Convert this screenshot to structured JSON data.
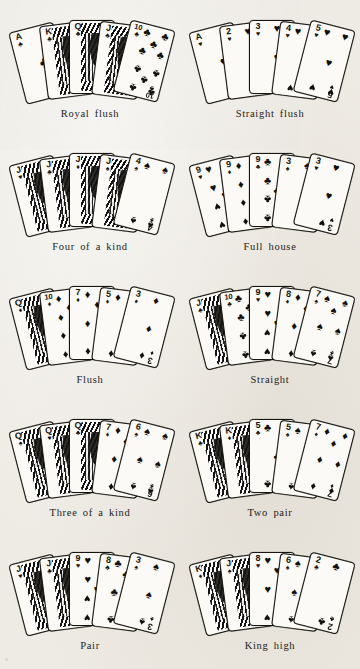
{
  "page": {
    "background_color": "#eeebe4",
    "ink_color": "#15130e",
    "corner_mark": "°"
  },
  "suits": {
    "spade": "♠",
    "heart": "♥",
    "diamond": "♦",
    "club": "♣"
  },
  "hands": [
    {
      "label": "Royal flush",
      "cards": [
        {
          "rank": "A",
          "suit": "club",
          "face": false
        },
        {
          "rank": "K",
          "suit": "club",
          "face": true
        },
        {
          "rank": "Q",
          "suit": "club",
          "face": true
        },
        {
          "rank": "J",
          "suit": "club",
          "face": true
        },
        {
          "rank": "10",
          "suit": "club",
          "face": false
        }
      ]
    },
    {
      "label": "Straight flush",
      "cards": [
        {
          "rank": "A",
          "suit": "heart",
          "face": false
        },
        {
          "rank": "2",
          "suit": "heart",
          "face": false
        },
        {
          "rank": "3",
          "suit": "heart",
          "face": false
        },
        {
          "rank": "4",
          "suit": "heart",
          "face": false
        },
        {
          "rank": "5",
          "suit": "heart",
          "face": false
        }
      ]
    },
    {
      "label": "Four of a kind",
      "cards": [
        {
          "rank": "J",
          "suit": "heart",
          "face": true
        },
        {
          "rank": "J",
          "suit": "club",
          "face": true
        },
        {
          "rank": "J",
          "suit": "diamond",
          "face": true
        },
        {
          "rank": "J",
          "suit": "spade",
          "face": true
        },
        {
          "rank": "4",
          "suit": "spade",
          "face": false
        }
      ]
    },
    {
      "label": "Full house",
      "cards": [
        {
          "rank": "9",
          "suit": "heart",
          "face": false
        },
        {
          "rank": "9",
          "suit": "diamond",
          "face": false
        },
        {
          "rank": "9",
          "suit": "club",
          "face": false
        },
        {
          "rank": "3",
          "suit": "spade",
          "face": false
        },
        {
          "rank": "3",
          "suit": "heart",
          "face": false
        }
      ]
    },
    {
      "label": "Flush",
      "cards": [
        {
          "rank": "Q",
          "suit": "diamond",
          "face": true
        },
        {
          "rank": "10",
          "suit": "diamond",
          "face": false
        },
        {
          "rank": "7",
          "suit": "diamond",
          "face": false
        },
        {
          "rank": "5",
          "suit": "diamond",
          "face": false
        },
        {
          "rank": "3",
          "suit": "diamond",
          "face": false
        }
      ]
    },
    {
      "label": "Straight",
      "cards": [
        {
          "rank": "J",
          "suit": "club",
          "face": true
        },
        {
          "rank": "10",
          "suit": "club",
          "face": false
        },
        {
          "rank": "9",
          "suit": "heart",
          "face": false
        },
        {
          "rank": "8",
          "suit": "diamond",
          "face": false
        },
        {
          "rank": "7",
          "suit": "spade",
          "face": false
        }
      ]
    },
    {
      "label": "Three of a kind",
      "cards": [
        {
          "rank": "Q",
          "suit": "spade",
          "face": true
        },
        {
          "rank": "Q",
          "suit": "heart",
          "face": true
        },
        {
          "rank": "Q",
          "suit": "club",
          "face": true
        },
        {
          "rank": "7",
          "suit": "diamond",
          "face": false
        },
        {
          "rank": "6",
          "suit": "spade",
          "face": false
        }
      ]
    },
    {
      "label": "Two pair",
      "cards": [
        {
          "rank": "K",
          "suit": "club",
          "face": true
        },
        {
          "rank": "K",
          "suit": "diamond",
          "face": true
        },
        {
          "rank": "5",
          "suit": "club",
          "face": false
        },
        {
          "rank": "5",
          "suit": "spade",
          "face": false
        },
        {
          "rank": "7",
          "suit": "diamond",
          "face": false
        }
      ]
    },
    {
      "label": "Pair",
      "cards": [
        {
          "rank": "J",
          "suit": "heart",
          "face": true
        },
        {
          "rank": "J",
          "suit": "club",
          "face": true
        },
        {
          "rank": "9",
          "suit": "heart",
          "face": false
        },
        {
          "rank": "8",
          "suit": "club",
          "face": false
        },
        {
          "rank": "3",
          "suit": "spade",
          "face": false
        }
      ]
    },
    {
      "label": "King high",
      "cards": [
        {
          "rank": "K",
          "suit": "diamond",
          "face": true
        },
        {
          "rank": "J",
          "suit": "spade",
          "face": true
        },
        {
          "rank": "8",
          "suit": "heart",
          "face": false
        },
        {
          "rank": "6",
          "suit": "spade",
          "face": false
        },
        {
          "rank": "2",
          "suit": "club",
          "face": false
        }
      ]
    }
  ]
}
